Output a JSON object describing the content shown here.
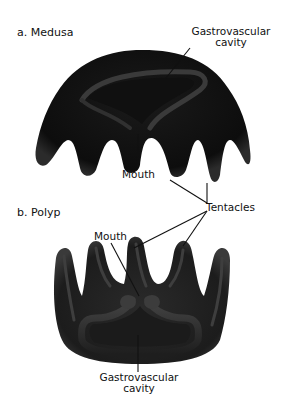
{
  "figure": {
    "panels": [
      {
        "id": "a",
        "title": "a. Medusa",
        "labels": {
          "gastrovascular_cavity_line1": "Gastrovascular",
          "gastrovascular_cavity_line2": "cavity",
          "mouth": "Mouth"
        }
      },
      {
        "id": "b",
        "title": "b. Polyp",
        "labels": {
          "mouth": "Mouth",
          "gastrovascular_cavity_line1": "Gastrovascular",
          "gastrovascular_cavity_line2": "cavity"
        }
      }
    ],
    "shared_labels": {
      "tentacles": "Tentacles"
    },
    "colors": {
      "body_dark": "#111111",
      "body_mid": "#2a2a2a",
      "highlight": "#4a4a4a",
      "label_text": "#111111",
      "background": "#ffffff"
    }
  }
}
